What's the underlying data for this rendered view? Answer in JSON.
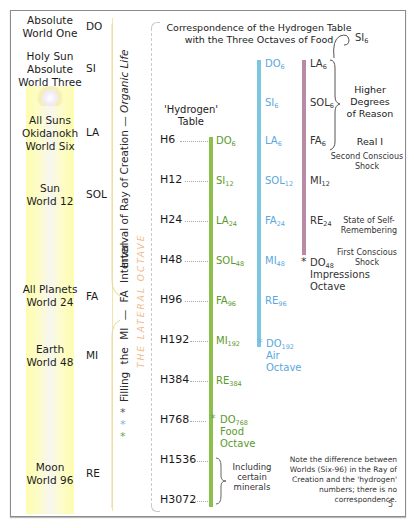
{
  "diagram": {
    "title_line1": "Correspondence of the Hydrogen Table",
    "title_line2": "with the Three Octaves of Food",
    "hydrogen_table_label_line1": "'Hydrogen'",
    "hydrogen_table_label_line2": "Table",
    "ray_of_creation": [
      {
        "world_line1": "Absolute",
        "world_line2": "World One",
        "world_line3": "",
        "note": "DO"
      },
      {
        "world_line1": "Holy Sun",
        "world_line2": "Absolute",
        "world_line3": "World Three",
        "note": "SI"
      },
      {
        "world_line1": "All Suns",
        "world_line2": "Okidanokh",
        "world_line3": "World Six",
        "note": "LA"
      },
      {
        "world_line1": "Sun",
        "world_line2": "World 12",
        "world_line3": "",
        "note": "SOL"
      },
      {
        "world_line1": "All Planets",
        "world_line2": "World 24",
        "world_line3": "",
        "note": "FA"
      },
      {
        "world_line1": "Earth",
        "world_line2": "World 48",
        "world_line3": "",
        "note": "MI"
      },
      {
        "world_line1": "Moon",
        "world_line2": "World 96",
        "world_line3": "",
        "note": "RE"
      }
    ],
    "vertical_text_upper_prefix": "Interval of Ray of Creation — ",
    "vertical_text_upper_italic": "Organic Life",
    "vertical_text_lower": "Filling the MI — FA Interval",
    "lateral_octave": "THE LATERAL OCTAVE",
    "hydrogens": [
      "H6",
      "H12",
      "H24",
      "H48",
      "H96",
      "H192",
      "H384",
      "H768",
      "H1536",
      "H3072"
    ],
    "food_octave": {
      "notes": [
        {
          "n": "DO",
          "s": "6"
        },
        {
          "n": "SI",
          "s": "12"
        },
        {
          "n": "LA",
          "s": "24"
        },
        {
          "n": "SOL",
          "s": "48"
        },
        {
          "n": "FA",
          "s": "96"
        },
        {
          "n": "MI",
          "s": "192"
        },
        {
          "n": "RE",
          "s": "384"
        },
        {
          "n": "DO",
          "s": "768"
        }
      ],
      "label_line1": "Food",
      "label_line2": "Octave",
      "color": "#8cc04a"
    },
    "air_octave": {
      "notes": [
        {
          "n": "DO",
          "s": "6"
        },
        {
          "n": "SI",
          "s": "6"
        },
        {
          "n": "LA",
          "s": "6"
        },
        {
          "n": "SOL",
          "s": "12"
        },
        {
          "n": "FA",
          "s": "24"
        },
        {
          "n": "MI",
          "s": "48"
        },
        {
          "n": "RE",
          "s": "96"
        },
        {
          "n": "DO",
          "s": "192"
        }
      ],
      "label_line1": "Air",
      "label_line2": "Octave",
      "color": "#7cc6e0"
    },
    "impressions_octave": {
      "notes": [
        {
          "n": "LA",
          "s": "6"
        },
        {
          "n": "SOL",
          "s": "6"
        },
        {
          "n": "FA",
          "s": "6"
        },
        {
          "n": "MI",
          "s": "12"
        },
        {
          "n": "RE",
          "s": "24"
        },
        {
          "n": "DO",
          "s": "48"
        }
      ],
      "label_line1": "Impressions",
      "label_line2": "Octave",
      "color": "#b98aa8"
    },
    "si6": {
      "n": "SI",
      "s": "6"
    },
    "annotations": {
      "higher_degrees": [
        "Higher",
        "Degrees",
        "of Reason"
      ],
      "real_i": "Real I",
      "second_shock": [
        "Second Conscious",
        "Shock"
      ],
      "self_remembering": [
        "State of Self-",
        "Remembering"
      ],
      "first_shock": [
        "First Conscious",
        "Shock"
      ],
      "minerals": [
        "Including",
        "certain",
        "minerals"
      ]
    },
    "footnote": [
      "Note the difference between",
      "Worlds (Six-96) in the Ray of",
      "Creation and the 'hydrogen'",
      "numbers; there is no",
      "correspondence."
    ],
    "page_number": "5",
    "asterisk": "*"
  }
}
